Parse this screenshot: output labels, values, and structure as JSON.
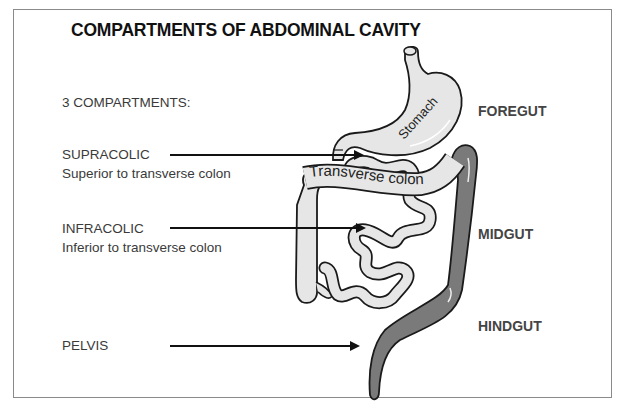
{
  "title": "COMPARTMENTS OF ABDOMINAL CAVITY",
  "intro": "3 COMPARTMENTS:",
  "compartments": [
    {
      "name": "SUPRACOLIC",
      "description": "Superior to transverse colon"
    },
    {
      "name": "INFRACOLIC",
      "description": "Inferior to transverse colon"
    },
    {
      "name": "PELVIS",
      "description": ""
    }
  ],
  "regions": {
    "foregut": "FOREGUT",
    "midgut": "MIDGUT",
    "hindgut": "HINDGUT"
  },
  "organs": {
    "stomach": "Stomach",
    "transverse_colon": "Transverse colon"
  },
  "colors": {
    "frame": "#8a8a8a",
    "organ_fill": "#e6e6e6",
    "hindgut_fill": "#7a7a7a",
    "outline": "#1a1a1a",
    "text": "#3a3a3a"
  }
}
